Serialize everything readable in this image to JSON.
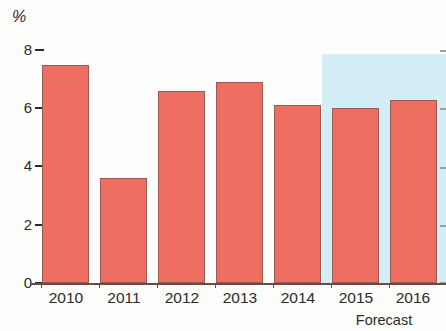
{
  "chart_data": {
    "type": "bar",
    "title": "",
    "subtitle": "",
    "xlabel": "",
    "ylabel": "%",
    "unit_label": "%",
    "categories": [
      "2010",
      "2011",
      "2012",
      "2013",
      "2014",
      "2015",
      "2016"
    ],
    "values": [
      7.5,
      3.6,
      6.6,
      6.9,
      6.1,
      6.0,
      6.3
    ],
    "series": [
      {
        "name": "Growth",
        "values": [
          7.5,
          3.6,
          6.6,
          6.9,
          6.1,
          6.0,
          6.3
        ]
      }
    ],
    "ylim": [
      0,
      8
    ],
    "ytick_labels": [
      "0",
      "2",
      "4",
      "6",
      "8"
    ],
    "ytick_values": [
      0,
      2,
      4,
      6,
      8
    ],
    "grid": false,
    "legend": null,
    "annotations": [
      {
        "text": "Forecast",
        "categories": [
          "2015",
          "2016"
        ],
        "kind": "shaded-region-caption"
      }
    ],
    "forecast_region": {
      "label": "Forecast",
      "start_category": "2015",
      "end_category": "2016",
      "shading_color": "#d3eef6"
    },
    "colors": {
      "bar_fill": "#ef6e62",
      "bar_border": "#9c5a55",
      "forecast_band": "#d3eef6",
      "axis": "#6b4b46",
      "text": "#2b2b2b",
      "background": "#fdfdfc"
    }
  }
}
